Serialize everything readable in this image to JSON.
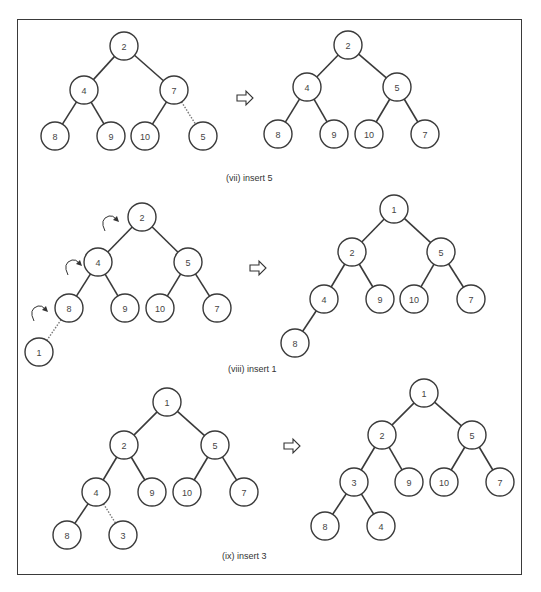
{
  "node_radius": 14,
  "colors": {
    "stroke": "#3a3a3a",
    "fill": "#ffffff",
    "text": "#444444",
    "dotted_edge": "#777777"
  },
  "panels": [
    {
      "id": "vii",
      "caption": "(vii) insert 5",
      "caption_pos": [
        226,
        181
      ],
      "transition_arrow": [
        245,
        98
      ],
      "before": {
        "nodes": [
          {
            "id": "a",
            "label": "2",
            "x": 124,
            "y": 46
          },
          {
            "id": "b",
            "label": "4",
            "x": 84,
            "y": 90
          },
          {
            "id": "c",
            "label": "7",
            "x": 174,
            "y": 90
          },
          {
            "id": "d",
            "label": "8",
            "x": 55,
            "y": 136
          },
          {
            "id": "e",
            "label": "9",
            "x": 111,
            "y": 136
          },
          {
            "id": "f",
            "label": "10",
            "x": 145,
            "y": 136
          },
          {
            "id": "g",
            "label": "5",
            "x": 203,
            "y": 136
          }
        ],
        "edges": [
          {
            "from": "a",
            "to": "b"
          },
          {
            "from": "a",
            "to": "c"
          },
          {
            "from": "b",
            "to": "d"
          },
          {
            "from": "b",
            "to": "e"
          },
          {
            "from": "c",
            "to": "f"
          },
          {
            "from": "c",
            "to": "g",
            "style": "dotted"
          }
        ],
        "swap_arrows": []
      },
      "after": {
        "nodes": [
          {
            "id": "a",
            "label": "2",
            "x": 348,
            "y": 45
          },
          {
            "id": "b",
            "label": "4",
            "x": 307,
            "y": 87
          },
          {
            "id": "c",
            "label": "5",
            "x": 397,
            "y": 87
          },
          {
            "id": "d",
            "label": "8",
            "x": 278,
            "y": 134
          },
          {
            "id": "e",
            "label": "9",
            "x": 334,
            "y": 134
          },
          {
            "id": "f",
            "label": "10",
            "x": 369,
            "y": 134
          },
          {
            "id": "g",
            "label": "7",
            "x": 425,
            "y": 134
          }
        ],
        "edges": [
          {
            "from": "a",
            "to": "b"
          },
          {
            "from": "a",
            "to": "c"
          },
          {
            "from": "b",
            "to": "d"
          },
          {
            "from": "b",
            "to": "e"
          },
          {
            "from": "c",
            "to": "f"
          },
          {
            "from": "c",
            "to": "g"
          }
        ]
      }
    },
    {
      "id": "viii",
      "caption": "(viii) insert 1",
      "caption_pos": [
        228,
        372
      ],
      "transition_arrow": [
        258,
        268
      ],
      "before": {
        "nodes": [
          {
            "id": "a",
            "label": "2",
            "x": 142,
            "y": 217
          },
          {
            "id": "b",
            "label": "4",
            "x": 98,
            "y": 262
          },
          {
            "id": "c",
            "label": "5",
            "x": 188,
            "y": 262
          },
          {
            "id": "d",
            "label": "8",
            "x": 69,
            "y": 308
          },
          {
            "id": "e",
            "label": "9",
            "x": 125,
            "y": 308
          },
          {
            "id": "f",
            "label": "10",
            "x": 160,
            "y": 308
          },
          {
            "id": "g",
            "label": "7",
            "x": 217,
            "y": 308
          },
          {
            "id": "h",
            "label": "1",
            "x": 39,
            "y": 352
          }
        ],
        "edges": [
          {
            "from": "a",
            "to": "b"
          },
          {
            "from": "a",
            "to": "c"
          },
          {
            "from": "b",
            "to": "d"
          },
          {
            "from": "b",
            "to": "e"
          },
          {
            "from": "c",
            "to": "f"
          },
          {
            "from": "c",
            "to": "g"
          },
          {
            "from": "d",
            "to": "h",
            "style": "dotted"
          }
        ],
        "swap_arrows": [
          {
            "x": 107,
            "y": 223
          },
          {
            "x": 70,
            "y": 267
          },
          {
            "x": 36,
            "y": 313
          }
        ]
      },
      "after": {
        "nodes": [
          {
            "id": "a",
            "label": "1",
            "x": 394,
            "y": 209
          },
          {
            "id": "b",
            "label": "2",
            "x": 352,
            "y": 252
          },
          {
            "id": "c",
            "label": "5",
            "x": 441,
            "y": 252
          },
          {
            "id": "d",
            "label": "4",
            "x": 324,
            "y": 299
          },
          {
            "id": "e",
            "label": "9",
            "x": 380,
            "y": 299
          },
          {
            "id": "f",
            "label": "10",
            "x": 414,
            "y": 299
          },
          {
            "id": "g",
            "label": "7",
            "x": 471,
            "y": 299
          },
          {
            "id": "h",
            "label": "8",
            "x": 295,
            "y": 343
          }
        ],
        "edges": [
          {
            "from": "a",
            "to": "b"
          },
          {
            "from": "a",
            "to": "c"
          },
          {
            "from": "b",
            "to": "d"
          },
          {
            "from": "b",
            "to": "e"
          },
          {
            "from": "c",
            "to": "f"
          },
          {
            "from": "c",
            "to": "g"
          },
          {
            "from": "d",
            "to": "h"
          }
        ]
      }
    },
    {
      "id": "ix",
      "caption": "(ix) insert 3",
      "caption_pos": [
        222,
        559
      ],
      "transition_arrow": [
        292,
        446
      ],
      "before": {
        "nodes": [
          {
            "id": "a",
            "label": "1",
            "x": 167,
            "y": 402
          },
          {
            "id": "b",
            "label": "2",
            "x": 124,
            "y": 445
          },
          {
            "id": "c",
            "label": "5",
            "x": 215,
            "y": 445
          },
          {
            "id": "d",
            "label": "4",
            "x": 96,
            "y": 492
          },
          {
            "id": "e",
            "label": "9",
            "x": 152,
            "y": 492
          },
          {
            "id": "f",
            "label": "10",
            "x": 187,
            "y": 492
          },
          {
            "id": "g",
            "label": "7",
            "x": 244,
            "y": 492
          },
          {
            "id": "h",
            "label": "8",
            "x": 67,
            "y": 535
          },
          {
            "id": "i",
            "label": "3",
            "x": 123,
            "y": 535
          }
        ],
        "edges": [
          {
            "from": "a",
            "to": "b"
          },
          {
            "from": "a",
            "to": "c"
          },
          {
            "from": "b",
            "to": "d"
          },
          {
            "from": "b",
            "to": "e"
          },
          {
            "from": "c",
            "to": "f"
          },
          {
            "from": "c",
            "to": "g"
          },
          {
            "from": "d",
            "to": "h"
          },
          {
            "from": "d",
            "to": "i",
            "style": "dotted"
          }
        ],
        "swap_arrows": []
      },
      "after": {
        "nodes": [
          {
            "id": "a",
            "label": "1",
            "x": 424,
            "y": 393
          },
          {
            "id": "b",
            "label": "2",
            "x": 382,
            "y": 435
          },
          {
            "id": "c",
            "label": "5",
            "x": 472,
            "y": 435
          },
          {
            "id": "d",
            "label": "3",
            "x": 354,
            "y": 482
          },
          {
            "id": "e",
            "label": "9",
            "x": 409,
            "y": 482
          },
          {
            "id": "f",
            "label": "10",
            "x": 444,
            "y": 482
          },
          {
            "id": "g",
            "label": "7",
            "x": 500,
            "y": 482
          },
          {
            "id": "h",
            "label": "8",
            "x": 325,
            "y": 526
          },
          {
            "id": "i",
            "label": "4",
            "x": 381,
            "y": 526
          }
        ],
        "edges": [
          {
            "from": "a",
            "to": "b"
          },
          {
            "from": "a",
            "to": "c"
          },
          {
            "from": "b",
            "to": "d"
          },
          {
            "from": "b",
            "to": "e"
          },
          {
            "from": "c",
            "to": "f"
          },
          {
            "from": "c",
            "to": "g"
          },
          {
            "from": "d",
            "to": "h"
          },
          {
            "from": "d",
            "to": "i"
          }
        ]
      }
    }
  ]
}
